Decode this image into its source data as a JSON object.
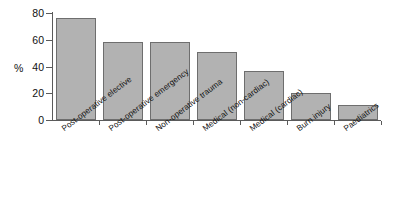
{
  "chart_data": {
    "type": "bar",
    "title": "",
    "subtitle": "",
    "xlabel": "",
    "ylabel": "%",
    "ylim": [
      0,
      80
    ],
    "yticks": [
      0,
      20,
      40,
      60,
      80
    ],
    "ytick_labels": [
      "0",
      "20",
      "40",
      "60",
      "80"
    ],
    "grid": false,
    "legend": false,
    "categories": [
      "Post-operative elective",
      "Post-operative emergency",
      "Non-operative trauma",
      "Medical (non-cardiac)",
      "Medical (cardiac)",
      "Burn injury",
      "Paediatrics"
    ],
    "values": [
      76,
      58,
      58,
      51,
      37,
      20,
      11
    ],
    "bar_color": "#b2b2b2",
    "bar_edge_color": "#6e6e6e",
    "axis_color": "#5a5a5a",
    "text_color": "#111111",
    "background": "#ffffff"
  }
}
